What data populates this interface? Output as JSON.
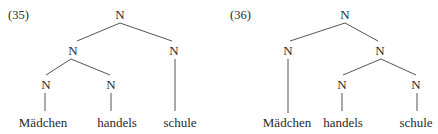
{
  "trees": [
    {
      "number": "(35)",
      "root": "N",
      "left": "N",
      "right": "N",
      "left_left": "N",
      "left_right": "N",
      "words": [
        "Mädchen",
        "handels",
        "schule"
      ]
    },
    {
      "number": "(36)",
      "root": "N",
      "left": "N",
      "right": "N",
      "right_left": "N",
      "right_right": "N",
      "words": [
        "Mädchen",
        "handels",
        "schule"
      ]
    }
  ],
  "colors": {
    "text": "#2a2a2a",
    "lines": "#555555",
    "background": "#ffffff"
  }
}
